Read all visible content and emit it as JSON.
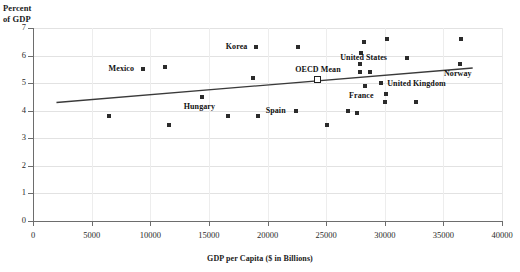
{
  "chart_data": {
    "type": "scatter",
    "title": "",
    "xlabel": "GDP per Capita ($ in Billions)",
    "ylabel": "Percent\nof GDP",
    "xlim": [
      0,
      40000
    ],
    "ylim": [
      0,
      7
    ],
    "grid": true,
    "legend_position": "none",
    "xticks": [
      0,
      5000,
      10000,
      15000,
      20000,
      25000,
      30000,
      35000,
      40000
    ],
    "xtick_labels": [
      "0",
      "5000",
      "10000",
      "15000",
      "20000",
      "25000",
      "30000",
      "35000",
      "40000"
    ],
    "yticks": [
      0,
      1,
      2,
      3,
      4,
      5,
      6,
      7
    ],
    "ytick_labels": [
      "0",
      "1",
      "2",
      "3",
      "4",
      "5",
      "6",
      "7"
    ],
    "points": [
      {
        "x": 6500,
        "y": 3.8,
        "label": "",
        "label_side": "left"
      },
      {
        "x": 9400,
        "y": 5.5,
        "label": "Mexico",
        "label_side": "left"
      },
      {
        "x": 11300,
        "y": 5.6,
        "label": "",
        "label_side": "left"
      },
      {
        "x": 11600,
        "y": 3.5,
        "label": "",
        "label_side": "left"
      },
      {
        "x": 14400,
        "y": 4.5,
        "label": "Hungary",
        "label_side": "below"
      },
      {
        "x": 16600,
        "y": 3.8,
        "label": "",
        "label_side": "left"
      },
      {
        "x": 18800,
        "y": 5.2,
        "label": "",
        "label_side": "left"
      },
      {
        "x": 19200,
        "y": 3.8,
        "label": "",
        "label_side": "left"
      },
      {
        "x": 19000,
        "y": 6.3,
        "label": "Korea",
        "label_side": "left"
      },
      {
        "x": 22600,
        "y": 6.3,
        "label": "",
        "label_side": "left"
      },
      {
        "x": 22400,
        "y": 4.0,
        "label": "Spain",
        "label_side": "left"
      },
      {
        "x": 24300,
        "y": 5.1,
        "label": "OECD Mean",
        "label_side": "above",
        "marker": "open-square"
      },
      {
        "x": 25100,
        "y": 3.5,
        "label": "",
        "label_side": "left"
      },
      {
        "x": 26900,
        "y": 4.0,
        "label": "",
        "label_side": "left"
      },
      {
        "x": 27600,
        "y": 3.9,
        "label": "",
        "label_side": "left"
      },
      {
        "x": 28200,
        "y": 6.5,
        "label": "",
        "label_side": "left"
      },
      {
        "x": 28000,
        "y": 6.1,
        "label": "",
        "label_side": "left"
      },
      {
        "x": 27900,
        "y": 5.7,
        "label": "",
        "label_side": "left"
      },
      {
        "x": 27900,
        "y": 5.4,
        "label": "",
        "label_side": "left"
      },
      {
        "x": 28700,
        "y": 5.4,
        "label": "",
        "label_side": "left"
      },
      {
        "x": 28300,
        "y": 4.9,
        "label": "France",
        "label_side": "below"
      },
      {
        "x": 29700,
        "y": 5.0,
        "label": "United Kingdom",
        "label_side": "right"
      },
      {
        "x": 30200,
        "y": 6.6,
        "label": "",
        "label_side": "left"
      },
      {
        "x": 30100,
        "y": 4.6,
        "label": "",
        "label_side": "left"
      },
      {
        "x": 30000,
        "y": 4.3,
        "label": "",
        "label_side": "left"
      },
      {
        "x": 32700,
        "y": 4.3,
        "label": "",
        "label_side": "left"
      },
      {
        "x": 31900,
        "y": 5.9,
        "label": "United States",
        "label_side": "left"
      },
      {
        "x": 36500,
        "y": 6.6,
        "label": "",
        "label_side": "left"
      },
      {
        "x": 36400,
        "y": 5.7,
        "label": "Norway",
        "label_side": "below"
      }
    ],
    "trendline": {
      "x_start": 2000,
      "y_start": 4.3,
      "x_end": 37500,
      "y_end": 5.55,
      "color": "#3a3a3a"
    }
  }
}
